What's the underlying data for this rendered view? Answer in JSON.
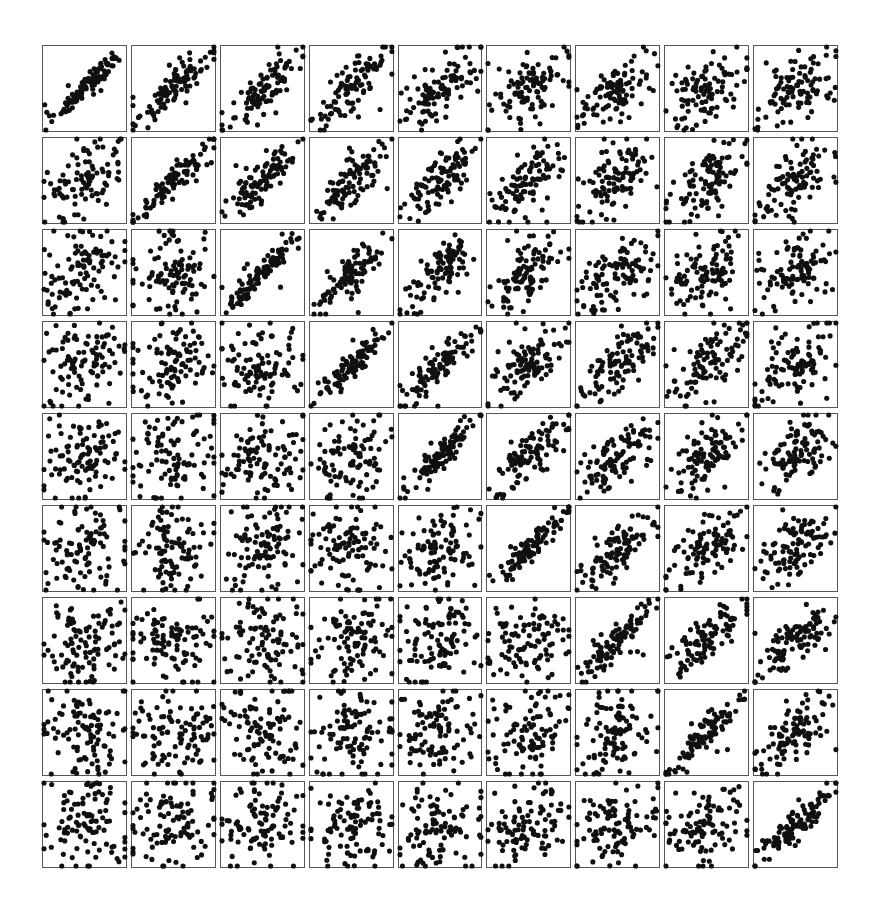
{
  "figure": {
    "type": "scatterplot-matrix",
    "title": "",
    "caption": "",
    "background_color": "#ffffff",
    "panel_border_color": "#57575a",
    "point_color": "#101010",
    "rows": 9,
    "columns": 9,
    "panel_count": 81,
    "points_per_panel": 100,
    "point_radius_px": 2.6,
    "grid_left_px": 42,
    "grid_top_px": 45,
    "grid_width_px": 796,
    "grid_height_px": 823,
    "cell_pitch_x_px": 88.5,
    "cell_pitch_y_px": 91.5,
    "axis_ticks": "none",
    "axis_labels": "none",
    "legend": "none"
  },
  "chart_data": {
    "type": "scatter",
    "title": "",
    "subtitle": "",
    "xlabel": "",
    "ylabel": "",
    "xlim": [
      0,
      1
    ],
    "ylim": [
      0,
      1
    ],
    "grid": false,
    "legend_position": "none",
    "layout": {
      "kind": "matrix",
      "rows": 9,
      "cols": 9,
      "shared_axes": true,
      "tick_labels": [],
      "panel_labels": []
    },
    "n_points_per_panel": 100,
    "correlation_matrix": [
      [
        0.96,
        0.88,
        0.82,
        0.78,
        0.7,
        0.58,
        0.52,
        0.5,
        0.44
      ],
      [
        0.46,
        0.93,
        0.86,
        0.8,
        0.74,
        0.6,
        0.55,
        0.52,
        0.46
      ],
      [
        0.34,
        0.22,
        0.94,
        0.87,
        0.76,
        0.64,
        0.58,
        0.55,
        0.48
      ],
      [
        0.14,
        0.1,
        0.12,
        0.93,
        0.84,
        0.68,
        0.62,
        0.58,
        0.52
      ],
      [
        0.16,
        0.12,
        0.1,
        0.14,
        0.92,
        0.74,
        0.66,
        0.6,
        0.56
      ],
      [
        0.12,
        0.08,
        0.1,
        0.12,
        0.18,
        0.91,
        0.72,
        0.66,
        0.62
      ],
      [
        0.1,
        0.06,
        0.08,
        0.1,
        0.14,
        0.22,
        0.9,
        0.74,
        0.68
      ],
      [
        0.14,
        0.1,
        0.08,
        0.1,
        0.12,
        0.18,
        0.24,
        0.89,
        0.72
      ],
      [
        0.12,
        0.1,
        0.12,
        0.14,
        0.16,
        0.18,
        0.2,
        0.26,
        0.88
      ]
    ],
    "series": [
      {
        "name": "panel-row-1",
        "correlations": [
          0.96,
          0.88,
          0.82,
          0.78,
          0.7,
          0.58,
          0.52,
          0.5,
          0.44
        ]
      },
      {
        "name": "panel-row-2",
        "correlations": [
          0.46,
          0.93,
          0.86,
          0.8,
          0.74,
          0.6,
          0.55,
          0.52,
          0.46
        ]
      },
      {
        "name": "panel-row-3",
        "correlations": [
          0.34,
          0.22,
          0.94,
          0.87,
          0.76,
          0.64,
          0.58,
          0.55,
          0.48
        ]
      },
      {
        "name": "panel-row-4",
        "correlations": [
          0.14,
          0.1,
          0.12,
          0.93,
          0.84,
          0.68,
          0.62,
          0.58,
          0.52
        ]
      },
      {
        "name": "panel-row-5",
        "correlations": [
          0.16,
          0.12,
          0.1,
          0.14,
          0.92,
          0.74,
          0.66,
          0.6,
          0.56
        ]
      },
      {
        "name": "panel-row-6",
        "correlations": [
          0.12,
          0.08,
          0.1,
          0.12,
          0.18,
          0.91,
          0.72,
          0.66,
          0.62
        ]
      },
      {
        "name": "panel-row-7",
        "correlations": [
          0.1,
          0.06,
          0.08,
          0.1,
          0.14,
          0.22,
          0.9,
          0.74,
          0.68
        ]
      },
      {
        "name": "panel-row-8",
        "correlations": [
          0.14,
          0.1,
          0.08,
          0.1,
          0.12,
          0.18,
          0.24,
          0.89,
          0.72
        ]
      },
      {
        "name": "panel-row-9",
        "correlations": [
          0.12,
          0.1,
          0.12,
          0.14,
          0.16,
          0.18,
          0.2,
          0.26,
          0.88
        ]
      }
    ]
  }
}
